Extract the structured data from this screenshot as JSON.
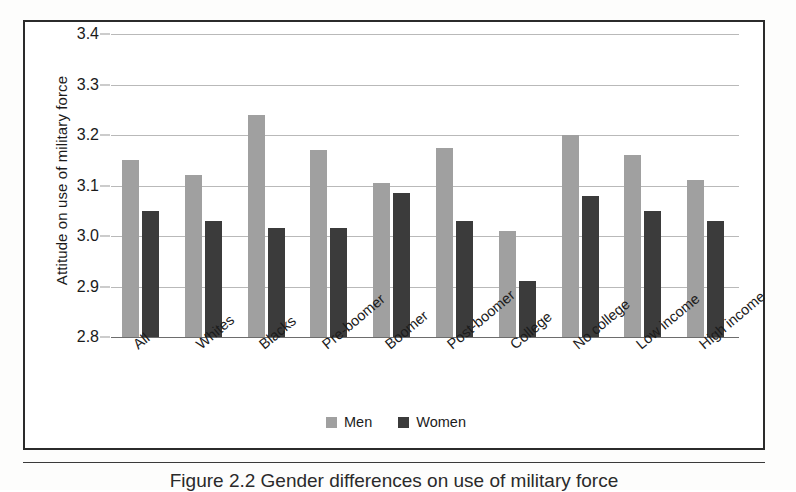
{
  "figure": {
    "caption": "Figure 2.2  Gender differences on use of military force"
  },
  "chart_data": {
    "type": "bar",
    "title": "",
    "xlabel": "",
    "ylabel": "Attitude on use of military force",
    "ylim": [
      2.8,
      3.4
    ],
    "yticks": [
      "3.4",
      "3.3",
      "3.2",
      "3.1",
      "3.0",
      "2.9",
      "2.8"
    ],
    "ytick_values": [
      3.4,
      3.3,
      3.2,
      3.1,
      3.0,
      2.9,
      2.8
    ],
    "grid": true,
    "legend_position": "bottom-center",
    "categories": [
      "All",
      "Whites",
      "Blacks",
      "Pre-boomer",
      "Boomer",
      "Post-boomer",
      "College",
      "No college",
      "Low income",
      "High income"
    ],
    "series": [
      {
        "name": "Men",
        "color": "#a0a0a0",
        "values": [
          3.15,
          3.12,
          3.24,
          3.17,
          3.105,
          3.175,
          3.01,
          3.2,
          3.16,
          3.11
        ]
      },
      {
        "name": "Women",
        "color": "#3b3b3b",
        "values": [
          3.05,
          3.03,
          3.015,
          3.015,
          3.085,
          3.03,
          2.91,
          3.08,
          3.05,
          3.03
        ]
      }
    ]
  }
}
